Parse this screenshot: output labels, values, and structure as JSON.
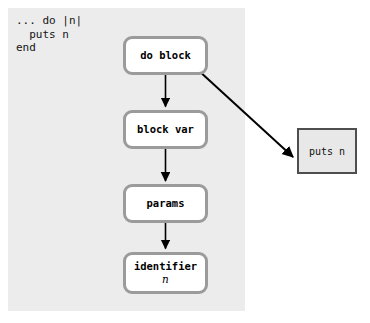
{
  "diagram": {
    "panel_color": "#ececec",
    "background_color": "#ffffff",
    "node_border_color": "#9b9b9b",
    "node_fill_color": "#ffffff",
    "output_border_color": "#4e4e4e",
    "output_fill_color": "#e8e8e8",
    "arrow_color": "#000000"
  },
  "code": {
    "label": "ruby-source-snippet",
    "text": "... do |n|\n  puts n\nend",
    "line1": "... do |n|",
    "line2": "  puts n",
    "line3": "end"
  },
  "nodes": [
    {
      "id": "do-block",
      "label": "do block",
      "sub": ""
    },
    {
      "id": "block-var",
      "label": "block var",
      "sub": ""
    },
    {
      "id": "params",
      "label": "params",
      "sub": ""
    },
    {
      "id": "identifier",
      "label": "identifier",
      "sub": "n"
    }
  ],
  "output_node": {
    "id": "puts-n",
    "label": "puts n"
  },
  "edges": [
    {
      "from": "do-block",
      "to": "block-var"
    },
    {
      "from": "block-var",
      "to": "params"
    },
    {
      "from": "params",
      "to": "identifier"
    },
    {
      "from": "do-block",
      "to": "puts-n"
    }
  ]
}
